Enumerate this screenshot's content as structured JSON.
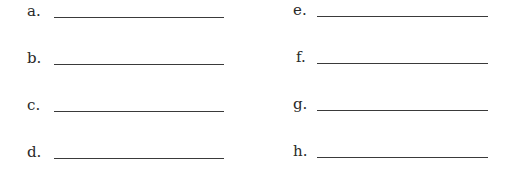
{
  "worksheet": {
    "left_column": [
      {
        "label": "a.",
        "value": ""
      },
      {
        "label": "b.",
        "value": ""
      },
      {
        "label": "c.",
        "value": ""
      },
      {
        "label": "d.",
        "value": ""
      }
    ],
    "right_column": [
      {
        "label": "e.",
        "value": ""
      },
      {
        "label": "f.",
        "value": ""
      },
      {
        "label": "g.",
        "value": ""
      },
      {
        "label": "h.",
        "value": ""
      }
    ]
  }
}
